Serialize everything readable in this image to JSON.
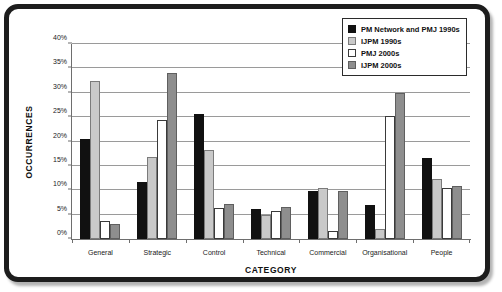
{
  "chart_data": {
    "type": "bar",
    "title": "",
    "xlabel": "CATEGORY",
    "ylabel": "OCCURRENCES",
    "categories": [
      "General",
      "Strategic",
      "Control",
      "Technical",
      "Commercial",
      "Organisational",
      "People"
    ],
    "series": [
      {
        "name": "PM Network and PMJ 1990s",
        "color": "#111111",
        "values": [
          20.5,
          11.7,
          25.7,
          6.2,
          9.8,
          7.0,
          16.6
        ]
      },
      {
        "name": "IJPM 1990s",
        "color": "#c9c9c9",
        "values": [
          32.4,
          16.8,
          18.2,
          4.9,
          10.4,
          2.0,
          12.3
        ]
      },
      {
        "name": "PMJ 2000s",
        "color": "#ffffff",
        "values": [
          3.7,
          24.4,
          6.4,
          5.8,
          1.6,
          25.2,
          10.4
        ]
      },
      {
        "name": "IJPM 2000s",
        "color": "#8e8e8e",
        "values": [
          3.0,
          34.0,
          7.2,
          6.5,
          9.8,
          29.9,
          10.8
        ]
      }
    ],
    "ylim": [
      0,
      40
    ],
    "yticks": [
      "0%",
      "5%",
      "10%",
      "15%",
      "20%",
      "25%",
      "30%",
      "35%",
      "40%"
    ],
    "ytick_values": [
      0,
      5,
      10,
      15,
      20,
      25,
      30,
      35,
      40
    ],
    "grid": true,
    "legend_position": "top-right"
  },
  "legend": {
    "entries": [
      {
        "label": "PM Network and PMJ 1990s"
      },
      {
        "label": "IJPM 1990s"
      },
      {
        "label": "PMJ 2000s"
      },
      {
        "label": "IJPM 2000s"
      }
    ]
  }
}
